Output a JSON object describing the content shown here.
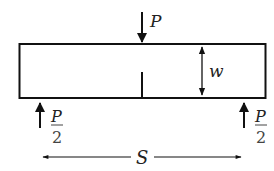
{
  "diagram": {
    "type": "three-point-bend-specimen",
    "labels": {
      "load": "P",
      "support_left_numerator": "P",
      "support_left_denominator": "2",
      "support_right_numerator": "P",
      "support_right_denominator": "2",
      "width": "w",
      "span": "S"
    },
    "colors": {
      "stroke": "#111111",
      "text": "#222222",
      "background": "#ffffff"
    }
  }
}
